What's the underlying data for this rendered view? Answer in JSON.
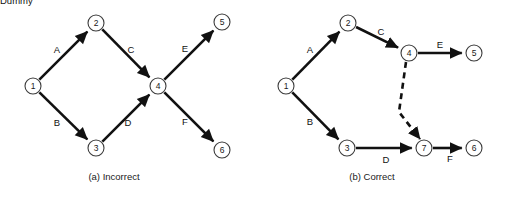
{
  "figure": {
    "background_color": "#ffffff",
    "line_color": "#111111",
    "node_stroke_color": "#3b3b3b",
    "node_fill_color": "#ffffff",
    "width": 507,
    "height": 197
  },
  "panels": [
    {
      "id": "panel-a",
      "caption": "(a) Incorrect",
      "caption_pos": {
        "x": 114,
        "y": 176
      },
      "nodes": [
        {
          "id": "a1",
          "label": "1",
          "x": 33,
          "y": 86,
          "r": 8
        },
        {
          "id": "a2",
          "label": "2",
          "x": 96,
          "y": 23,
          "r": 8
        },
        {
          "id": "a3",
          "label": "3",
          "x": 96,
          "y": 148,
          "r": 8
        },
        {
          "id": "a4",
          "label": "4",
          "x": 158,
          "y": 86,
          "r": 8
        },
        {
          "id": "a5",
          "label": "5",
          "x": 222,
          "y": 22,
          "r": 8
        },
        {
          "id": "a6",
          "label": "6",
          "x": 222,
          "y": 150,
          "r": 8
        }
      ],
      "edges": [
        {
          "id": "a-A",
          "label": "A",
          "from": "a1",
          "to": "a2",
          "style": "solid",
          "label_x": 57,
          "label_y": 49
        },
        {
          "id": "a-B",
          "label": "B",
          "from": "a1",
          "to": "a3",
          "style": "solid",
          "label_x": 57,
          "label_y": 122
        },
        {
          "id": "a-C",
          "label": "C",
          "from": "a2",
          "to": "a4",
          "style": "solid",
          "label_x": 131,
          "label_y": 49
        },
        {
          "id": "a-D",
          "label": "D",
          "from": "a3",
          "to": "a4",
          "style": "solid",
          "label_x": 128,
          "label_y": 122
        },
        {
          "id": "a-E",
          "label": "E",
          "from": "a4",
          "to": "a5",
          "style": "solid",
          "label_x": 185,
          "label_y": 48
        },
        {
          "id": "a-F",
          "label": "F",
          "from": "a4",
          "to": "a6",
          "style": "solid",
          "label_x": 185,
          "label_y": 121
        }
      ]
    },
    {
      "id": "panel-b",
      "caption": "(b) Correct",
      "caption_pos": {
        "x": 372,
        "y": 176
      },
      "nodes": [
        {
          "id": "b1",
          "label": "1",
          "x": 286,
          "y": 86,
          "r": 8
        },
        {
          "id": "b2",
          "label": "2",
          "x": 348,
          "y": 23,
          "r": 8
        },
        {
          "id": "b3",
          "label": "3",
          "x": 347,
          "y": 148,
          "r": 8
        },
        {
          "id": "b4",
          "label": "4",
          "x": 409,
          "y": 53,
          "r": 8
        },
        {
          "id": "b5",
          "label": "5",
          "x": 474,
          "y": 53,
          "r": 8
        },
        {
          "id": "b7",
          "label": "7",
          "x": 424,
          "y": 148,
          "r": 8
        },
        {
          "id": "b6",
          "label": "6",
          "x": 474,
          "y": 148,
          "r": 8
        }
      ],
      "edges": [
        {
          "id": "b-A",
          "label": "A",
          "from": "b1",
          "to": "b2",
          "style": "solid",
          "label_x": 310,
          "label_y": 49
        },
        {
          "id": "b-B",
          "label": "B",
          "from": "b1",
          "to": "b3",
          "style": "solid",
          "label_x": 310,
          "label_y": 121
        },
        {
          "id": "b-C",
          "label": "C",
          "from": "b2",
          "to": "b4",
          "style": "solid",
          "label_x": 381,
          "label_y": 31
        },
        {
          "id": "b-D",
          "label": "D",
          "from": "b3",
          "to": "b7",
          "style": "solid",
          "label_x": 386,
          "label_y": 159
        },
        {
          "id": "b-E",
          "label": "E",
          "from": "b4",
          "to": "b5",
          "style": "solid",
          "label_x": 440,
          "label_y": 44
        },
        {
          "id": "b-F",
          "label": "F",
          "from": "b7",
          "to": "b6",
          "style": "solid",
          "label_x": 450,
          "label_y": 158
        },
        {
          "id": "b-Dummy",
          "label": "Dummy",
          "from": "b4",
          "to": "b7",
          "style": "dashed",
          "label_x": 418,
          "label_y": 101
        }
      ]
    }
  ]
}
